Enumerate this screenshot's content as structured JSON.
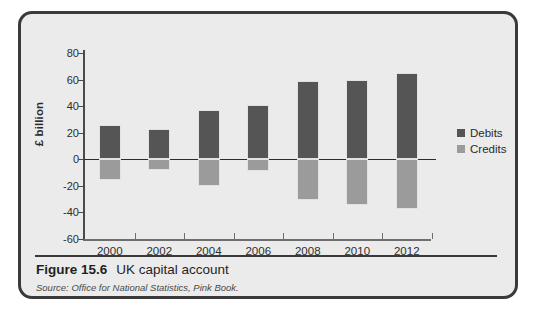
{
  "figure": {
    "number_label": "Figure 15.6",
    "title": "UK capital account",
    "source_prefix": "Source: Office for National Statistics,",
    "source_publication": "Pink Book."
  },
  "legend": {
    "items": [
      {
        "label": "Debits",
        "color": "#555555"
      },
      {
        "label": "Credits",
        "color": "#9b9b9b"
      }
    ]
  },
  "axis": {
    "y_title": "£ billion",
    "y_ticks": [
      "80",
      "60",
      "40",
      "20",
      "0",
      "-20",
      "-40",
      "-60"
    ],
    "x_ticks": [
      "2000",
      "2002",
      "2004",
      "2006",
      "2008",
      "2010",
      "2012"
    ]
  },
  "chart_data": {
    "type": "bar",
    "title": "UK capital account",
    "xlabel": "",
    "ylabel": "£ billion",
    "ylim": [
      -60,
      80
    ],
    "ytick_step": 20,
    "grid": false,
    "legend_position": "right",
    "categories": [
      "2000",
      "2002",
      "2004",
      "2006",
      "2008",
      "2010",
      "2012"
    ],
    "series": [
      {
        "name": "Debits",
        "color": "#555555",
        "values": [
          26,
          23,
          37,
          41,
          59,
          60,
          65
        ]
      },
      {
        "name": "Credits",
        "color": "#9b9b9b",
        "values": [
          -16,
          -8,
          -20,
          -9,
          -31,
          -35,
          -38
        ]
      }
    ],
    "units": "£ billion",
    "source": "Office for National Statistics, Pink Book."
  }
}
